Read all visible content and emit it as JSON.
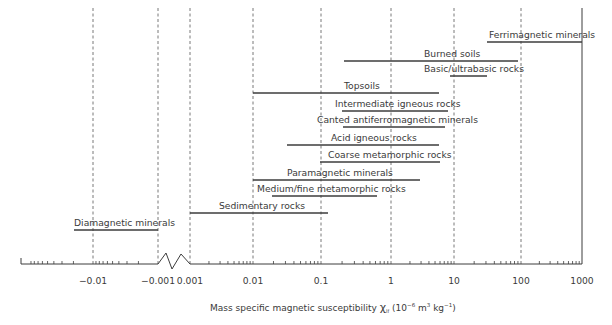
{
  "chart_data": {
    "type": "range-bar",
    "title": "",
    "xlabel": "Mass specific magnetic susceptibility χlf (10⁻⁶ m³ kg⁻¹)",
    "xlabel_parts": {
      "pre": "Mass specific magnetic susceptibility ",
      "symbol": "χ",
      "sub": "lf",
      "unit_pre": " (10",
      "exp1": "−6",
      "unit_mid": " m",
      "exp2": "3",
      "unit_mid2": " kg",
      "exp3": "−1",
      "unit_post": ")"
    },
    "ylabel": "",
    "x_scale": "log (broken axis around zero)",
    "x_ticks": [
      "-0.01",
      "-0.001",
      "0.001",
      "0.01",
      "0.1",
      "1",
      "10",
      "100",
      "1000"
    ],
    "grid": "vertical dashed lines at each decade",
    "series": [
      {
        "name": "Ferrimagnetic minerals",
        "min": 30,
        "max": 1000
      },
      {
        "name": "Burned soils",
        "min": 0.2,
        "max": 90
      },
      {
        "name": "Basic/ultrabasic rocks",
        "min": 9,
        "max": 33
      },
      {
        "name": "Topsoils",
        "min": 0.01,
        "max": 15
      },
      {
        "name": "Intermediate igneous rocks",
        "min": 0.2,
        "max": 8
      },
      {
        "name": "Canted antiferromagnetic minerals",
        "min": 0.2,
        "max": 7
      },
      {
        "name": "Acid igneous rocks",
        "min": 0.03,
        "max": 6
      },
      {
        "name": "Coarse metamorphic rocks",
        "min": 0.1,
        "max": 6
      },
      {
        "name": "Paramagnetic minerals",
        "min": 0.01,
        "max": 3
      },
      {
        "name": "Medium/fine metamorphic rocks",
        "min": 0.02,
        "max": 0.6
      },
      {
        "name": "Sedimentary rocks",
        "min": 0.001,
        "max": 0.12
      },
      {
        "name": "Diamagnetic minerals",
        "min": -0.02,
        "max": -0.001
      }
    ]
  },
  "bars": [
    {
      "label": "Ferrimagnetic minerals",
      "x1": 487,
      "x2": 582,
      "y": 42,
      "lx": 489
    },
    {
      "label": "Burned soils",
      "x1": 344,
      "x2": 518,
      "y": 61,
      "lx": 424
    },
    {
      "label": "Basic/ultrabasic rocks",
      "x1": 450,
      "x2": 487,
      "y": 76,
      "lx": 424
    },
    {
      "label": "Topsoils",
      "x1": 253,
      "x2": 439,
      "y": 93,
      "lx": 344
    },
    {
      "label": "Intermediate igneous rocks",
      "x1": 342,
      "x2": 448,
      "y": 111,
      "lx": 335
    },
    {
      "label": "Canted antiferromagnetic minerals",
      "x1": 343,
      "x2": 445,
      "y": 127,
      "lx": 317
    },
    {
      "label": "Acid igneous rocks",
      "x1": 287,
      "x2": 439,
      "y": 145,
      "lx": 331
    },
    {
      "label": "Coarse metamorphic rocks",
      "x1": 320,
      "x2": 440,
      "y": 162,
      "lx": 328
    },
    {
      "label": "Paramagnetic minerals",
      "x1": 253,
      "x2": 420,
      "y": 180,
      "lx": 287
    },
    {
      "label": "Medium/fine metamorphic rocks",
      "x1": 272,
      "x2": 377,
      "y": 196,
      "lx": 257
    },
    {
      "label": "Sedimentary rocks",
      "x1": 190,
      "x2": 328,
      "y": 213,
      "lx": 219
    },
    {
      "label": "Diamagnetic minerals",
      "x1": 74,
      "x2": 158,
      "y": 230,
      "lx": 74
    }
  ],
  "ticks": [
    {
      "label": "-0.01",
      "x": 93
    },
    {
      "label": "-0.001",
      "x": 158
    },
    {
      "label": "0.001",
      "x": 190
    },
    {
      "label": "0.01",
      "x": 253
    },
    {
      "label": "0.1",
      "x": 321
    },
    {
      "label": "1",
      "x": 391
    },
    {
      "label": "10",
      "x": 454
    },
    {
      "label": "100",
      "x": 521
    },
    {
      "label": "1000",
      "x": 582
    }
  ],
  "colors": {
    "line": "#3d3d3d",
    "grid": "#555555",
    "text": "#3a3a3a"
  }
}
